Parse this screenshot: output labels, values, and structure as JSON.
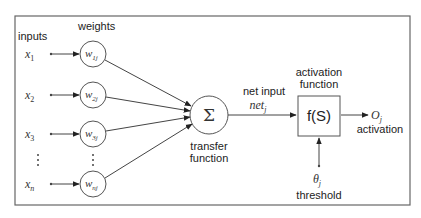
{
  "diagram": {
    "type": "perceptron / artificial neuron model",
    "labels": {
      "inputs": "inputs",
      "weights": "weights",
      "net_input": "net input",
      "net_symbol": "net",
      "net_sub": "j",
      "transfer_function_line1": "transfer",
      "transfer_function_line2": "function",
      "activation_function_line1": "activation",
      "activation_function_line2": "function",
      "activation_output_symbol": "O",
      "activation_output_sub": "j",
      "activation_label": "activation",
      "threshold_symbol": "θ",
      "threshold_sub": "j",
      "threshold_label": "threshold",
      "sum_symbol": "Σ",
      "function_box": "f(S)",
      "vertical_ellipsis": "⋮"
    },
    "inputs": [
      {
        "symbol": "x",
        "sub": "1"
      },
      {
        "symbol": "x",
        "sub": "2"
      },
      {
        "symbol": "x",
        "sub": "3"
      },
      {
        "symbol": "x",
        "sub": "n"
      }
    ],
    "weights": [
      {
        "symbol": "w",
        "sub": "1j"
      },
      {
        "symbol": "w",
        "sub": "2j"
      },
      {
        "symbol": "w",
        "sub": "3j"
      },
      {
        "symbol": "w",
        "sub": "nj"
      }
    ],
    "colors": {
      "stroke": "#444444",
      "text": "#222222",
      "background": "#ffffff",
      "frame": "#666666"
    }
  }
}
